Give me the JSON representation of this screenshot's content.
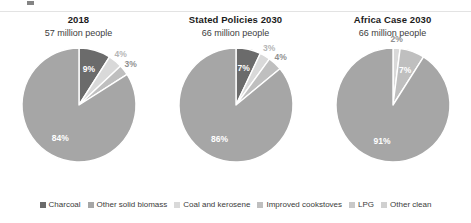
{
  "chart_data": {
    "type": "pie",
    "title": "",
    "legend_position": "bottom",
    "legend": [
      {
        "label": "Charcoal",
        "color": "#6b6b6b"
      },
      {
        "label": "Other solid biomass",
        "color": "#a6a6a6"
      },
      {
        "label": "Coal and kerosene",
        "color": "#d9d9d9"
      },
      {
        "label": "Improved cookstoves",
        "color": "#bfbfbf"
      },
      {
        "label": "LPG",
        "color": "#c9c9c9"
      },
      {
        "label": "Other clean",
        "color": "#d0d0d0"
      }
    ],
    "panels": [
      {
        "title": "2018",
        "subtitle": "57 million people",
        "slices": [
          {
            "name": "Charcoal",
            "value": 9,
            "label": "9%",
            "color": "#6b6b6b",
            "label_style": "white"
          },
          {
            "name": "Coal and kerosene",
            "value": 4,
            "label": "4%",
            "color": "#d9d9d9",
            "label_style": "grey"
          },
          {
            "name": "Improved cookstoves",
            "value": 3,
            "label": "3%",
            "color": "#bfbfbf",
            "label_style": "dgrey"
          },
          {
            "name": "Other solid biomass",
            "value": 84,
            "label": "84%",
            "color": "#a6a6a6",
            "label_style": "white"
          }
        ]
      },
      {
        "title": "Stated Policies 2030",
        "subtitle": "66 million people",
        "slices": [
          {
            "name": "Charcoal",
            "value": 7,
            "label": "7%",
            "color": "#6b6b6b",
            "label_style": "white"
          },
          {
            "name": "Coal and kerosene",
            "value": 3,
            "label": "3%",
            "color": "#d9d9d9",
            "label_style": "grey"
          },
          {
            "name": "Improved cookstoves",
            "value": 4,
            "label": "4%",
            "color": "#bfbfbf",
            "label_style": "dgrey"
          },
          {
            "name": "Other solid biomass",
            "value": 86,
            "label": "86%",
            "color": "#a6a6a6",
            "label_style": "white"
          }
        ]
      },
      {
        "title": "Africa Case 2030",
        "subtitle": "66 million people",
        "slices": [
          {
            "name": "Coal and kerosene",
            "value": 2,
            "label": "2%",
            "color": "#d9d9d9",
            "label_style": "dgrey"
          },
          {
            "name": "Improved cookstoves",
            "value": 7,
            "label": "7%",
            "color": "#bfbfbf",
            "label_style": "white"
          },
          {
            "name": "Other solid biomass",
            "value": 91,
            "label": "91%",
            "color": "#a6a6a6",
            "label_style": "white"
          }
        ]
      }
    ]
  }
}
